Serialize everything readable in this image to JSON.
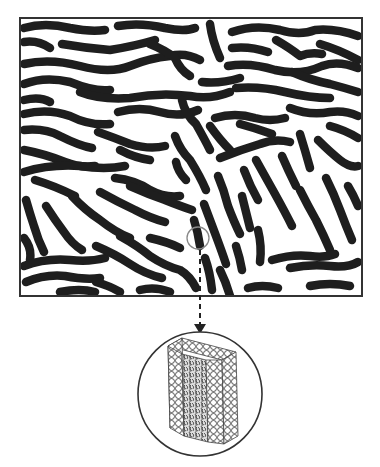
{
  "figure": {
    "panel": {
      "x": 20,
      "y": 18,
      "width": 342,
      "height": 278,
      "border_color": "#333333",
      "stripe_color": "#1e1e1e",
      "background": "#ffffff"
    },
    "magnifier_small": {
      "cx": 198,
      "cy": 238,
      "r": 11,
      "color": "#888888"
    },
    "arrow": {
      "x": 200,
      "y1": 250,
      "y2": 332,
      "style": "dashed",
      "color": "#222222"
    },
    "inset_circle": {
      "cx": 200,
      "cy": 394,
      "r": 62,
      "color": "#333333",
      "content": "bilayer-block"
    }
  }
}
